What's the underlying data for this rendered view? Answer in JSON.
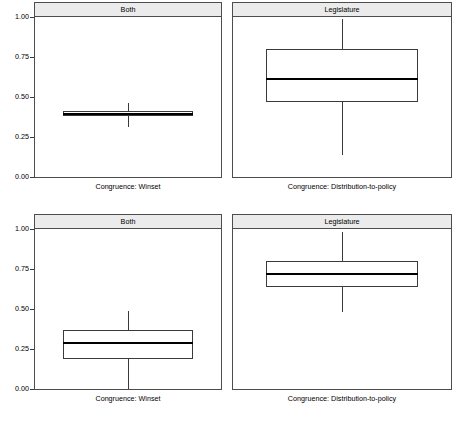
{
  "figure": {
    "background": "#ffffff",
    "axis_color": "#3a3a3a",
    "strip_background": "#ebebeb",
    "strip_border": "#4d4d4d",
    "box_fill": "#ffffff",
    "median_color": "#000000"
  },
  "axis": {
    "ticks": [
      "1.00",
      "0.75",
      "0.50",
      "0.25",
      "0.00"
    ],
    "tick_values": [
      1.0,
      0.75,
      0.5,
      0.25,
      0.0
    ],
    "ylim": [
      0.0,
      1.0
    ]
  },
  "panels": [
    {
      "strip": "Both",
      "xlabel": "Congruence: Winset",
      "row": 0,
      "col": 0
    },
    {
      "strip": "Legislature",
      "xlabel": "Congruence: Distribution-to-policy",
      "row": 0,
      "col": 1
    },
    {
      "strip": "Both",
      "xlabel": "Congruence: Winset",
      "row": 1,
      "col": 0
    },
    {
      "strip": "Legislature",
      "xlabel": "Congruence: Distribution-to-policy",
      "row": 1,
      "col": 1
    }
  ],
  "chart_data": {
    "type": "box",
    "title": "",
    "xlabel": "",
    "ylabel": "",
    "ylim": [
      0.0,
      1.0
    ],
    "yticks": [
      0.0,
      0.25,
      0.5,
      0.75,
      1.0
    ],
    "ytick_labels": [
      "0.00",
      "0.25",
      "0.50",
      "0.75",
      "1.00"
    ],
    "grid": false,
    "legend": "none",
    "layout": "2x2 trellis",
    "panel_titles": [
      "Both",
      "Legislature",
      "Both",
      "Legislature"
    ],
    "panel_xlabels": [
      "Congruence: Winset",
      "Congruence: Distribution-to-policy",
      "Congruence: Winset",
      "Congruence: Distribution-to-policy"
    ],
    "boxes": [
      {
        "panel": "Both / Congruence: Winset (top-left)",
        "row": 0,
        "col": 0,
        "min": 0.31,
        "q1": 0.38,
        "median": 0.395,
        "q3": 0.41,
        "max": 0.46
      },
      {
        "panel": "Legislature / Congruence: Distribution-to-policy (top-right)",
        "row": 0,
        "col": 1,
        "min": 0.14,
        "q1": 0.47,
        "median": 0.61,
        "q3": 0.8,
        "max": 0.99
      },
      {
        "panel": "Both / Congruence: Winset (bottom-left)",
        "row": 1,
        "col": 0,
        "min": 0.0,
        "q1": 0.185,
        "median": 0.285,
        "q3": 0.37,
        "max": 0.49
      },
      {
        "panel": "Legislature / Congruence: Distribution-to-policy (bottom-right)",
        "row": 1,
        "col": 1,
        "min": 0.48,
        "q1": 0.635,
        "median": 0.72,
        "q3": 0.8,
        "max": 0.98
      }
    ]
  }
}
